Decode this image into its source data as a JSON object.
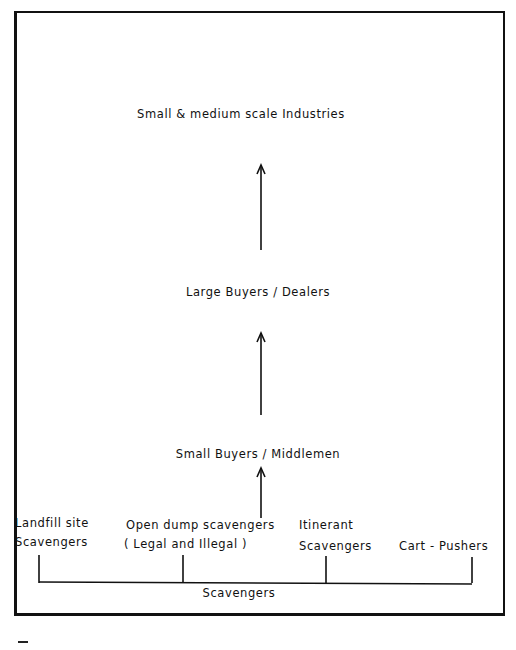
{
  "diagram": {
    "type": "flow",
    "levels": [
      {
        "id": "industries",
        "label": "Small & medium scale Industries"
      },
      {
        "id": "large_buyers",
        "label": "Large Buyers / Dealers"
      },
      {
        "id": "small_buyers",
        "label": "Small Buyers / Middlemen"
      }
    ],
    "scavengers": {
      "group_label": "Scavengers",
      "types": [
        {
          "line1": "Landfill site",
          "line2": "Scavengers"
        },
        {
          "line1": "Open dump scavengers",
          "line2": "( Legal and Illegal )"
        },
        {
          "line1": "Itinerant",
          "line2": "Scavengers"
        },
        {
          "line1": "",
          "line2": "Cart - Pushers"
        }
      ]
    },
    "edges": [
      {
        "from": "scavengers",
        "to": "small_buyers"
      },
      {
        "from": "small_buyers",
        "to": "large_buyers"
      },
      {
        "from": "large_buyers",
        "to": "industries"
      }
    ]
  }
}
